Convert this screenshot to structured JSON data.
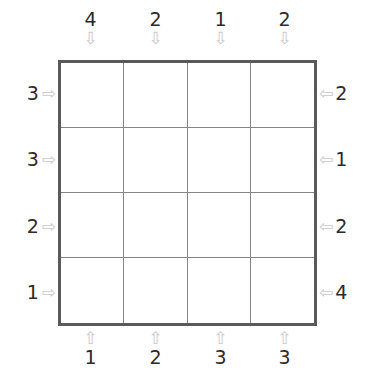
{
  "puzzle": {
    "type": "skyscrapers",
    "size": 4,
    "grid_values": [
      [
        "",
        "",
        "",
        ""
      ],
      [
        "",
        "",
        "",
        ""
      ],
      [
        "",
        "",
        "",
        ""
      ],
      [
        "",
        "",
        "",
        ""
      ]
    ],
    "colors": {
      "outer_border": "#5a5a5a",
      "inner_line": "#858585",
      "digit": "#2b2b2b",
      "arrow": "#c9c9c9",
      "background": "#ffffff"
    },
    "clues": {
      "top": {
        "arrow_glyph": "⇩",
        "arrow_name": "arrow-down-icon",
        "values": [
          "4",
          "2",
          "1",
          "2"
        ]
      },
      "bottom": {
        "arrow_glyph": "⇧",
        "arrow_name": "arrow-up-icon",
        "values": [
          "1",
          "2",
          "3",
          "3"
        ]
      },
      "left": {
        "arrow_glyph": "⇨",
        "arrow_name": "arrow-right-icon",
        "values": [
          "3",
          "3",
          "2",
          "1"
        ]
      },
      "right": {
        "arrow_glyph": "⇦",
        "arrow_name": "arrow-left-icon",
        "values": [
          "2",
          "1",
          "2",
          "4"
        ]
      }
    }
  }
}
